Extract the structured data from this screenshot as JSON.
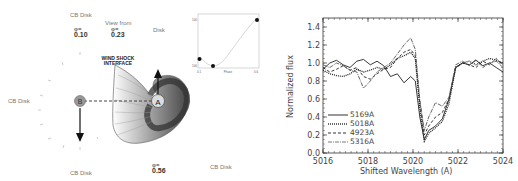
{
  "diagram": {
    "labels": {
      "cb_disk_top": "CB Disk",
      "view_from": "View from",
      "disk_top_right": "Disk",
      "cb_disk_left": "CB Disk",
      "cb_disk_bottom_left": "CB Disk",
      "cb_disk_bottom_right": "CB Disk",
      "wind_shock_line1": "WIND SHOCK",
      "wind_shock_line2": "INTERFACE",
      "star_a": "A",
      "star_b": "B"
    },
    "phases": [
      {
        "prefix": "φ=",
        "value": "0.10"
      },
      {
        "prefix": "φ=",
        "value": "0.23"
      },
      {
        "prefix": "φ=",
        "value": "0.56"
      }
    ],
    "inset": {
      "xlabel": "Phase",
      "ylabel": "Δ (km/s)",
      "ytick_top": "100",
      "ytick_bottom": "-100",
      "xtick_left": "0.1",
      "xtick_right": "0.6",
      "points": [
        [
          0.1,
          0.22
        ],
        [
          0.23,
          0.05
        ],
        [
          0.56,
          0.92
        ]
      ]
    }
  },
  "chart_data": {
    "type": "line",
    "title": "",
    "xlabel": "Shifted Wavelength (A)",
    "ylabel": "Normalized flux",
    "xlim": [
      5016,
      5024
    ],
    "ylim": [
      0.0,
      1.5
    ],
    "xticks": [
      "5016",
      "5018",
      "5020",
      "5022",
      "5024"
    ],
    "yticks": [
      "0.0",
      "0.2",
      "0.4",
      "0.6",
      "0.8",
      "1.0",
      "1.2",
      "1.4"
    ],
    "grid": false,
    "legend_position": "lower left",
    "series": [
      {
        "name": "5169A",
        "style": "solid",
        "x": [
          5016,
          5016.3,
          5016.6,
          5016.9,
          5017.2,
          5017.5,
          5017.8,
          5018.1,
          5018.4,
          5018.7,
          5019.0,
          5019.3,
          5019.6,
          5019.9,
          5020.1,
          5020.3,
          5020.5,
          5020.7,
          5021.0,
          5021.3,
          5021.6,
          5021.9,
          5022.2,
          5022.5,
          5022.8,
          5023.1,
          5023.4,
          5023.7,
          5024
        ],
        "y": [
          0.93,
          1.0,
          1.03,
          0.98,
          0.95,
          1.02,
          1.04,
          0.98,
          1.02,
          0.97,
          0.85,
          0.88,
          0.78,
          0.85,
          0.8,
          0.4,
          0.15,
          0.25,
          0.3,
          0.38,
          0.6,
          0.95,
          1.0,
          0.98,
          1.03,
          0.97,
          1.0,
          0.95,
          0.9
        ]
      },
      {
        "name": "5018A",
        "style": "dotted",
        "x": [
          5016,
          5016.3,
          5016.6,
          5016.9,
          5017.2,
          5017.5,
          5017.8,
          5018.1,
          5018.4,
          5018.7,
          5019.0,
          5019.3,
          5019.6,
          5019.9,
          5020.1,
          5020.3,
          5020.5,
          5020.7,
          5021.0,
          5021.3,
          5021.6,
          5021.9,
          5022.2,
          5022.5,
          5022.8,
          5023.1,
          5023.4,
          5023.7,
          5024
        ],
        "y": [
          0.92,
          0.88,
          0.86,
          0.85,
          0.88,
          0.93,
          0.9,
          0.92,
          0.95,
          0.93,
          0.98,
          1.05,
          1.08,
          1.12,
          1.05,
          0.5,
          0.13,
          0.22,
          0.28,
          0.35,
          0.55,
          0.95,
          1.0,
          1.02,
          0.98,
          1.02,
          1.05,
          1.03,
          1.0
        ]
      },
      {
        "name": "4923A",
        "style": "dashed",
        "x": [
          5016,
          5016.3,
          5016.6,
          5016.9,
          5017.2,
          5017.5,
          5017.8,
          5018.1,
          5018.4,
          5018.7,
          5019.0,
          5019.3,
          5019.6,
          5019.9,
          5020.1,
          5020.3,
          5020.5,
          5020.7,
          5021.0,
          5021.3,
          5021.6,
          5021.9,
          5022.2,
          5022.5,
          5022.8,
          5023.1,
          5023.4,
          5023.7,
          5024
        ],
        "y": [
          0.95,
          0.9,
          0.93,
          0.97,
          0.92,
          0.95,
          0.85,
          0.82,
          0.88,
          0.93,
          0.95,
          1.05,
          1.12,
          1.15,
          1.08,
          0.55,
          0.2,
          0.3,
          0.4,
          0.45,
          0.6,
          0.95,
          1.0,
          0.98,
          0.95,
          1.02,
          0.98,
          1.05,
          0.98
        ]
      },
      {
        "name": "5316A",
        "style": "dash-dot",
        "x": [
          5016,
          5016.3,
          5016.6,
          5016.9,
          5017.2,
          5017.5,
          5017.8,
          5018.1,
          5018.4,
          5018.7,
          5019.0,
          5019.3,
          5019.6,
          5019.9,
          5020.1,
          5020.3,
          5020.5,
          5020.7,
          5021.0,
          5021.3,
          5021.6,
          5021.9,
          5022.2,
          5022.5,
          5022.8,
          5023.1,
          5023.4,
          5023.7,
          5024
        ],
        "y": [
          0.98,
          0.95,
          1.0,
          0.97,
          0.92,
          0.9,
          0.72,
          0.8,
          0.9,
          0.95,
          1.0,
          1.1,
          1.2,
          1.28,
          1.15,
          0.6,
          0.25,
          0.4,
          0.56,
          0.52,
          0.62,
          0.98,
          1.02,
          0.97,
          1.04,
          0.95,
          1.0,
          1.02,
          0.95
        ]
      }
    ]
  }
}
